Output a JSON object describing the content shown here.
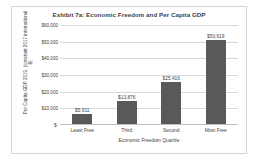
{
  "chart_data": {
    "type": "bar",
    "title": "Exhibit 7a: Economic Freedom and Per Capita GDP",
    "xlabel": "Economic Freedom Quartile",
    "ylabel": "Per Capita GDP 2019, (constant 2017 international $)",
    "categories": [
      "Least Free",
      "Third",
      "Second",
      "Most Free"
    ],
    "values": [
      5911,
      13876,
      25416,
      50619
    ],
    "value_labels": [
      "$5,911",
      "$13,876",
      "$25,416",
      "$50,619"
    ],
    "ylim": [
      0,
      60000
    ],
    "yticks": [
      0,
      10000,
      20000,
      30000,
      40000,
      50000,
      60000
    ],
    "ytick_labels": [
      "$-",
      "$10,000",
      "$20,000",
      "$30,000",
      "$40,000",
      "$50,000",
      "$60,000"
    ],
    "grid": true,
    "legend": false,
    "bar_color": "#595959",
    "grid_color": "#d9d9d9",
    "axis_color": "#bfbfbf",
    "text_color": "#3f3f3f",
    "background_color": "#ffffff",
    "border_color": "#d4d4d4"
  }
}
